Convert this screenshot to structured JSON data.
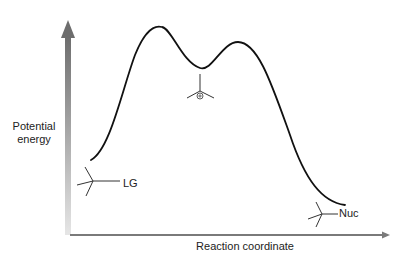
{
  "diagram": {
    "type": "reaction-energy-diagram",
    "y_axis_label_line1": "Potential",
    "y_axis_label_line2": "energy",
    "x_axis_label": "Reaction coordinate",
    "reactant_label": "LG",
    "product_label": "Nuc",
    "intermediate": "carbocation",
    "intermediate_charge_symbol": "⊕",
    "colors": {
      "curve": "#111111",
      "axis": "#7a7a7a",
      "text": "#222222"
    },
    "profile_points": [
      {
        "name": "reactant",
        "x": 91,
        "y": 160
      },
      {
        "name": "transition-state-1",
        "x": 160,
        "y": 27
      },
      {
        "name": "intermediate",
        "x": 200,
        "y": 68
      },
      {
        "name": "transition-state-2",
        "x": 238,
        "y": 42
      },
      {
        "name": "product",
        "x": 345,
        "y": 205
      }
    ]
  }
}
